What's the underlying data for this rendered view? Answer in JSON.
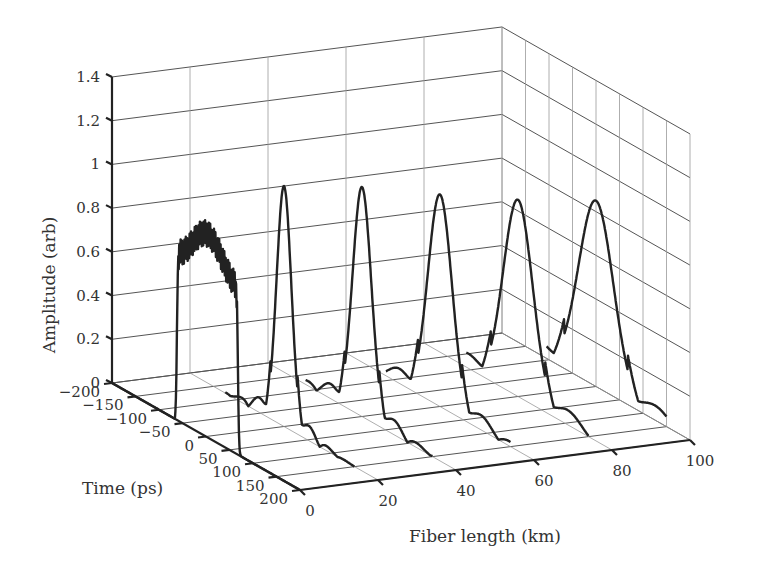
{
  "chart_data": {
    "type": "line",
    "subtype": "3d-waterfall",
    "title": "",
    "axes": {
      "z": {
        "label": "Amplitude (arb)",
        "ticks": [
          "0",
          "0.2",
          "0.4",
          "0.6",
          "0.8",
          "1",
          "1.2",
          "1.4"
        ],
        "range": [
          0,
          1.4
        ]
      },
      "x": {
        "label": "Time (ps)",
        "ticks": [
          "-200",
          "-150",
          "-100",
          "-50",
          "0",
          "50",
          "100",
          "150",
          "200"
        ],
        "range": [
          -200,
          200
        ]
      },
      "y": {
        "label": "Fiber length (km)",
        "ticks": [
          "0",
          "20",
          "40",
          "60",
          "80",
          "100"
        ],
        "range": [
          0,
          100
        ]
      }
    },
    "grid": true,
    "series": [
      {
        "name": "0 km",
        "fiber_km": 0,
        "shape": "square pulse with fast ripple",
        "peak_amplitude": 1.0,
        "width_ps": 130,
        "edge_overshoot": 1.0,
        "plateau": 0.85
      },
      {
        "name": "20 km",
        "fiber_km": 20,
        "shape": "narrow compressed peak",
        "peak_amplitude": 1.1,
        "fwhm_ps": 40
      },
      {
        "name": "40 km",
        "fiber_km": 40,
        "shape": "gaussian-like peak",
        "peak_amplitude": 1.05,
        "fwhm_ps": 55
      },
      {
        "name": "60 km",
        "fiber_km": 60,
        "shape": "gaussian-like peak",
        "peak_amplitude": 0.97,
        "fwhm_ps": 70
      },
      {
        "name": "80 km",
        "fiber_km": 80,
        "shape": "broadened peak",
        "peak_amplitude": 0.9,
        "fwhm_ps": 85
      },
      {
        "name": "100 km",
        "fiber_km": 100,
        "shape": "broadened peak",
        "peak_amplitude": 0.85,
        "fwhm_ps": 100
      }
    ]
  },
  "labels": {
    "z_title": "Amplitude (arb)",
    "x_title": "Time (ps)",
    "y_title": "Fiber length (km)"
  }
}
